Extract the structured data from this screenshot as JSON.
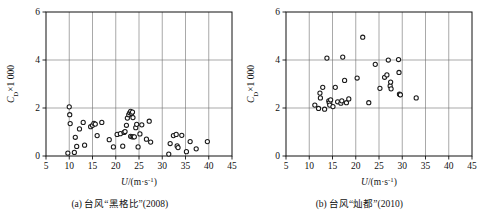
{
  "figure": {
    "panels": [
      {
        "id": "panel-a",
        "caption": "(a) 台风“黑格比”(2008)",
        "chart_index": 0
      },
      {
        "id": "panel-b",
        "caption": "(b) 台风“灿都”(2010)",
        "chart_index": 1
      }
    ]
  },
  "chart_data": [
    {
      "type": "scatter",
      "title": "",
      "subtitle": "(a) 台风“黑格比”(2008)",
      "xlabel": "U/(m·s⁻¹)",
      "ylabel": "C_D×1 000",
      "xlabel_parts": {
        "italic": "U",
        "slash": "/(m·s",
        "sup": "-1",
        "close": ")"
      },
      "ylabel_parts": {
        "italic": "C",
        "sub": "D",
        "rest": "×1 000"
      },
      "xlim": [
        5,
        45
      ],
      "ylim": [
        0,
        6
      ],
      "xticks": [
        5,
        10,
        15,
        20,
        25,
        30,
        35,
        40,
        45
      ],
      "yticks": [
        0,
        2,
        4,
        6
      ],
      "grid": true,
      "grid_x": [
        10,
        15,
        20,
        25,
        30,
        35,
        40
      ],
      "grid_y": [
        2,
        4
      ],
      "marker": "open-circle",
      "marker_color": "#1a1a1a",
      "points": [
        [
          9.7,
          0.12
        ],
        [
          10.0,
          2.05
        ],
        [
          10.1,
          1.72
        ],
        [
          10.2,
          1.35
        ],
        [
          11.1,
          0.15
        ],
        [
          11.3,
          0.78
        ],
        [
          11.6,
          0.4
        ],
        [
          12.2,
          1.13
        ],
        [
          13.0,
          1.4
        ],
        [
          13.3,
          0.45
        ],
        [
          14.6,
          1.22
        ],
        [
          15.0,
          1.28
        ],
        [
          15.3,
          1.36
        ],
        [
          15.6,
          1.33
        ],
        [
          16.0,
          0.85
        ],
        [
          17.0,
          1.4
        ],
        [
          18.6,
          0.68
        ],
        [
          19.5,
          0.38
        ],
        [
          20.3,
          0.9
        ],
        [
          21.0,
          0.93
        ],
        [
          21.5,
          0.41
        ],
        [
          21.8,
          0.98
        ],
        [
          22.0,
          1.02
        ],
        [
          22.3,
          1.28
        ],
        [
          22.5,
          1.58
        ],
        [
          22.8,
          1.72
        ],
        [
          23.0,
          1.8
        ],
        [
          23.2,
          1.86
        ],
        [
          23.4,
          1.78
        ],
        [
          23.6,
          1.83
        ],
        [
          23.7,
          1.6
        ],
        [
          23.2,
          0.82
        ],
        [
          23.5,
          0.8
        ],
        [
          23.8,
          0.8
        ],
        [
          24.0,
          0.8
        ],
        [
          24.3,
          1.18
        ],
        [
          24.5,
          1.32
        ],
        [
          24.8,
          0.38
        ],
        [
          25.2,
          0.92
        ],
        [
          25.6,
          1.3
        ],
        [
          26.6,
          0.7
        ],
        [
          27.2,
          1.45
        ],
        [
          27.5,
          0.58
        ],
        [
          31.4,
          0.08
        ],
        [
          31.7,
          0.52
        ],
        [
          32.4,
          0.85
        ],
        [
          33.0,
          0.9
        ],
        [
          33.2,
          0.42
        ],
        [
          33.4,
          0.35
        ],
        [
          34.2,
          0.86
        ],
        [
          35.2,
          0.18
        ],
        [
          36.0,
          0.6
        ],
        [
          37.3,
          0.3
        ],
        [
          39.7,
          0.6
        ]
      ]
    },
    {
      "type": "scatter",
      "title": "",
      "subtitle": "(b) 台风“灿都”(2010)",
      "xlabel": "U/(m·s⁻¹)",
      "ylabel": "C_D×1 000",
      "xlabel_parts": {
        "italic": "U",
        "slash": "/(m·s",
        "sup": "-1",
        "close": ")"
      },
      "ylabel_parts": {
        "italic": "C",
        "sub": "D",
        "rest": "×1 000"
      },
      "xlim": [
        5,
        45
      ],
      "ylim": [
        0,
        6
      ],
      "xticks": [
        5,
        10,
        15,
        20,
        25,
        30,
        35,
        40,
        45
      ],
      "yticks": [
        0,
        2,
        4,
        6
      ],
      "grid": true,
      "grid_x": [
        10,
        15,
        20,
        25,
        30,
        35,
        40
      ],
      "grid_y": [
        2,
        4
      ],
      "marker": "open-circle",
      "marker_color": "#1a1a1a",
      "points": [
        [
          11.2,
          2.12
        ],
        [
          12.0,
          1.98
        ],
        [
          12.3,
          2.62
        ],
        [
          12.4,
          2.42
        ],
        [
          12.9,
          2.86
        ],
        [
          13.3,
          1.95
        ],
        [
          13.8,
          4.08
        ],
        [
          14.2,
          2.3
        ],
        [
          14.3,
          2.22
        ],
        [
          14.4,
          2.12
        ],
        [
          14.6,
          2.34
        ],
        [
          15.1,
          2.06
        ],
        [
          15.6,
          2.86
        ],
        [
          16.1,
          2.26
        ],
        [
          16.8,
          2.2
        ],
        [
          17.0,
          2.3
        ],
        [
          17.2,
          4.12
        ],
        [
          17.6,
          3.15
        ],
        [
          18.0,
          2.22
        ],
        [
          18.5,
          2.38
        ],
        [
          20.3,
          3.25
        ],
        [
          21.5,
          4.95
        ],
        [
          22.8,
          2.22
        ],
        [
          24.2,
          3.82
        ],
        [
          25.2,
          2.82
        ],
        [
          26.2,
          3.28
        ],
        [
          26.7,
          3.38
        ],
        [
          27.0,
          4.0
        ],
        [
          27.4,
          2.92
        ],
        [
          27.5,
          3.08
        ],
        [
          27.6,
          2.8
        ],
        [
          29.2,
          4.02
        ],
        [
          29.3,
          3.48
        ],
        [
          29.4,
          2.58
        ],
        [
          29.5,
          2.56
        ],
        [
          29.6,
          2.55
        ],
        [
          33.0,
          2.42
        ]
      ]
    }
  ]
}
